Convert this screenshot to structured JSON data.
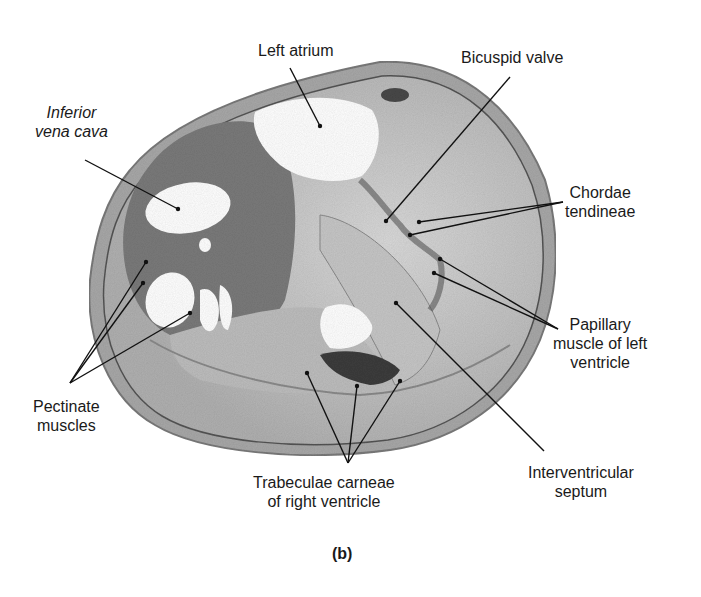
{
  "figure": {
    "caption": "(b)"
  },
  "labels": [
    {
      "id": "left-atrium",
      "lines": [
        "Left atrium"
      ],
      "italic": false,
      "x": 258,
      "y": 41,
      "align": "left",
      "leaders": [
        {
          "x1": 290,
          "y1": 68,
          "x2": 320,
          "y2": 126
        }
      ]
    },
    {
      "id": "inferior-vena-cava",
      "lines": [
        "Inferior",
        "vena cava"
      ],
      "italic": true,
      "x": 35,
      "y": 103,
      "align": "center",
      "leaders": [
        {
          "x1": 85,
          "y1": 160,
          "x2": 178,
          "y2": 209
        }
      ]
    },
    {
      "id": "bicuspid-valve",
      "lines": [
        "Bicuspid valve"
      ],
      "italic": false,
      "x": 461,
      "y": 48,
      "align": "left",
      "leaders": [
        {
          "x1": 510,
          "y1": 77,
          "x2": 386,
          "y2": 221
        }
      ]
    },
    {
      "id": "chordae-tendineae",
      "lines": [
        "Chordae",
        "tendineae"
      ],
      "italic": false,
      "x": 565,
      "y": 183,
      "align": "center",
      "leaders": [
        {
          "x1": 563,
          "y1": 202,
          "x2": 419,
          "y2": 222
        },
        {
          "x1": 563,
          "y1": 202,
          "x2": 410,
          "y2": 235
        }
      ]
    },
    {
      "id": "papillary-muscle",
      "lines": [
        "Papillary",
        "muscle of left",
        "ventricle"
      ],
      "italic": false,
      "x": 553,
      "y": 315,
      "align": "center",
      "leaders": [
        {
          "x1": 558,
          "y1": 329,
          "x2": 440,
          "y2": 259
        },
        {
          "x1": 558,
          "y1": 329,
          "x2": 434,
          "y2": 273
        }
      ]
    },
    {
      "id": "interventricular-septum",
      "lines": [
        "Interventricular",
        "septum"
      ],
      "italic": false,
      "x": 528,
      "y": 463,
      "align": "center",
      "leaders": [
        {
          "x1": 544,
          "y1": 451,
          "x2": 396,
          "y2": 303
        }
      ]
    },
    {
      "id": "trabeculae-carneae",
      "lines": [
        "Trabeculae carneae",
        "of right ventricle"
      ],
      "italic": false,
      "x": 253,
      "y": 473,
      "align": "center",
      "leaders": [
        {
          "x1": 348,
          "y1": 463,
          "x2": 307,
          "y2": 373
        },
        {
          "x1": 348,
          "y1": 463,
          "x2": 357,
          "y2": 386
        },
        {
          "x1": 348,
          "y1": 463,
          "x2": 400,
          "y2": 381
        }
      ]
    },
    {
      "id": "pectinate-muscles",
      "lines": [
        "Pectinate",
        "muscles"
      ],
      "italic": false,
      "x": 33,
      "y": 397,
      "align": "center",
      "leaders": [
        {
          "x1": 70,
          "y1": 383,
          "x2": 146,
          "y2": 262
        },
        {
          "x1": 70,
          "y1": 383,
          "x2": 143,
          "y2": 283
        },
        {
          "x1": 70,
          "y1": 383,
          "x2": 190,
          "y2": 313
        }
      ]
    }
  ],
  "colors": {
    "text": "#1a1a1a",
    "leader": "#111111",
    "tissue_light": "#c9c9c9",
    "tissue_mid": "#9a9a9a",
    "tissue_dark": "#6e6e6e",
    "cavity": "#ffffff"
  }
}
